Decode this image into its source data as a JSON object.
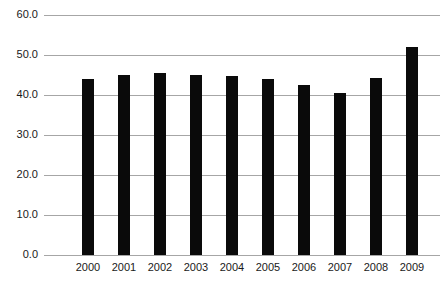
{
  "chart_data": {
    "type": "bar",
    "title": "",
    "subtitle": "",
    "xlabel": "",
    "ylabel": "",
    "categories": [
      "2000",
      "2001",
      "2002",
      "2003",
      "2004",
      "2005",
      "2006",
      "2007",
      "2008",
      "2009"
    ],
    "values": [
      44.0,
      45.0,
      45.4,
      44.9,
      44.7,
      44.1,
      42.4,
      40.6,
      44.3,
      52.0
    ],
    "ylim": [
      0.0,
      60.0
    ],
    "ytick_values": [
      0.0,
      10.0,
      20.0,
      30.0,
      40.0,
      50.0,
      60.0
    ],
    "ytick_labels": [
      "0.0",
      "10.0",
      "20.0",
      "30.0",
      "40.0",
      "50.0",
      "60.0"
    ],
    "grid": true,
    "grid_axis": "y",
    "legend": false,
    "legend_position": "none",
    "annotations": [],
    "series": [
      {
        "name": "",
        "values": [
          44.0,
          45.0,
          45.4,
          44.9,
          44.7,
          44.1,
          42.4,
          40.6,
          44.3,
          52.0
        ]
      }
    ]
  },
  "style": {
    "bar_color": "#0a0a0a",
    "grid_color": "#a6a6a6",
    "text_color": "#1a1a1a",
    "background_color": "#ffffff"
  }
}
